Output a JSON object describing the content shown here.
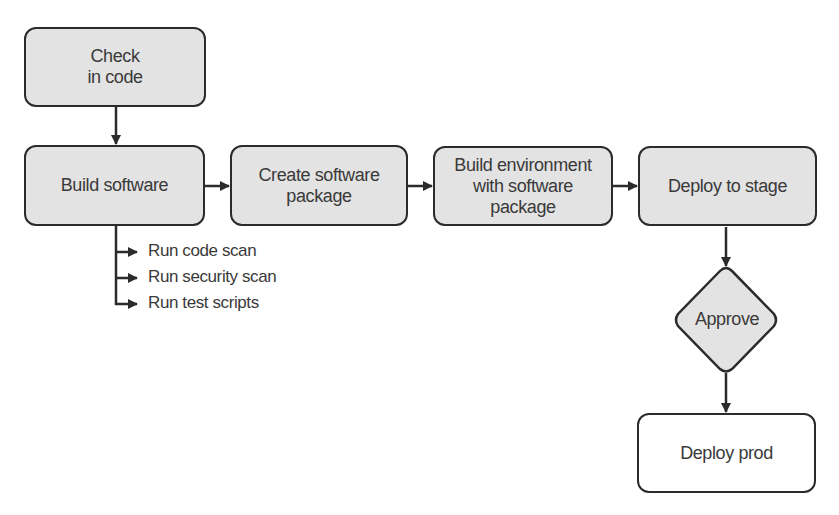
{
  "diagram": {
    "type": "flowchart",
    "colors": {
      "node_fill": "#e3e3e3",
      "node_border": "#2b2b2b",
      "final_node_fill": "#ffffff",
      "text": "#3a3a3a"
    },
    "nodes": {
      "check_in": {
        "label": "Check\nin code",
        "shape": "rounded-rect"
      },
      "build": {
        "label": "Build software",
        "shape": "rounded-rect"
      },
      "package": {
        "label": "Create software\npackage",
        "shape": "rounded-rect"
      },
      "environment": {
        "label": "Build environment\nwith software\npackage",
        "shape": "rounded-rect"
      },
      "stage": {
        "label": "Deploy to stage",
        "shape": "rounded-rect"
      },
      "approve": {
        "label": "Approve",
        "shape": "diamond"
      },
      "prod": {
        "label": "Deploy prod",
        "shape": "rounded-rect"
      }
    },
    "build_substeps": [
      {
        "label": "Run code scan"
      },
      {
        "label": "Run security scan"
      },
      {
        "label": "Run test scripts"
      }
    ],
    "edges": [
      {
        "from": "check_in",
        "to": "build"
      },
      {
        "from": "build",
        "to": "package"
      },
      {
        "from": "package",
        "to": "environment"
      },
      {
        "from": "environment",
        "to": "stage"
      },
      {
        "from": "stage",
        "to": "approve"
      },
      {
        "from": "approve",
        "to": "prod"
      }
    ]
  }
}
